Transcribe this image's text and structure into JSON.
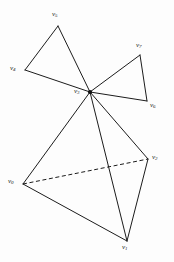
{
  "figure": {
    "background_color": "#fdfdfd",
    "stroke_color": "#1c1c1c",
    "width": 174,
    "height": 262
  },
  "chart_data": {
    "type": "diagram",
    "title": "",
    "xlabel": "",
    "ylabel": "",
    "grid": false,
    "legend": null,
    "coordinate_space": {
      "x_range": [
        0,
        174
      ],
      "y_range": [
        0,
        262
      ],
      "units": "px"
    },
    "vertices": [
      {
        "id": "v0",
        "label": "v",
        "subscript": "0",
        "x": 23,
        "y": 184,
        "label_x": 8,
        "label_y": 178,
        "dot": false
      },
      {
        "id": "v1",
        "label": "v",
        "subscript": "1",
        "x": 127,
        "y": 241,
        "label_x": 122,
        "label_y": 244,
        "dot": false
      },
      {
        "id": "v2",
        "label": "v",
        "subscript": "2",
        "x": 148,
        "y": 159,
        "label_x": 152,
        "label_y": 154,
        "dot": false
      },
      {
        "id": "v3",
        "label": "v",
        "subscript": "3",
        "x": 90,
        "y": 92,
        "label_x": 74,
        "label_y": 88,
        "dot": true
      },
      {
        "id": "v4",
        "label": "v",
        "subscript": "4",
        "x": 25,
        "y": 70,
        "label_x": 10,
        "label_y": 65,
        "dot": false
      },
      {
        "id": "v5",
        "label": "v",
        "subscript": "5",
        "x": 58,
        "y": 26,
        "label_x": 52,
        "label_y": 11,
        "dot": false
      },
      {
        "id": "v6",
        "label": "v",
        "subscript": "6",
        "x": 147,
        "y": 101,
        "label_x": 150,
        "label_y": 102,
        "dot": false
      },
      {
        "id": "v7",
        "label": "v",
        "subscript": "7",
        "x": 140,
        "y": 55,
        "label_x": 136,
        "label_y": 42,
        "dot": false
      }
    ],
    "edges": [
      {
        "from": "v5",
        "to": "v4",
        "style": "solid"
      },
      {
        "from": "v5",
        "to": "v3",
        "style": "solid"
      },
      {
        "from": "v4",
        "to": "v3",
        "style": "solid"
      },
      {
        "from": "v3",
        "to": "v7",
        "style": "solid"
      },
      {
        "from": "v7",
        "to": "v6",
        "style": "solid"
      },
      {
        "from": "v3",
        "to": "v6",
        "style": "solid"
      },
      {
        "from": "v3",
        "to": "v0",
        "style": "solid"
      },
      {
        "from": "v3",
        "to": "v1",
        "style": "solid"
      },
      {
        "from": "v3",
        "to": "v2",
        "style": "solid"
      },
      {
        "from": "v0",
        "to": "v1",
        "style": "solid"
      },
      {
        "from": "v1",
        "to": "v2",
        "style": "solid"
      },
      {
        "from": "v0",
        "to": "v2",
        "style": "dashed"
      }
    ],
    "edge_count": 12,
    "vertex_count": 8,
    "dashed_edge_count": 1
  }
}
